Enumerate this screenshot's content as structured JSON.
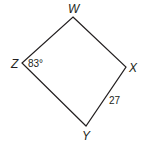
{
  "figure": {
    "shape": "quadrilateral",
    "vertices": [
      {
        "name": "W",
        "x": 73,
        "y": 17
      },
      {
        "name": "X",
        "x": 126,
        "y": 67
      },
      {
        "name": "Y",
        "x": 86,
        "y": 126
      },
      {
        "name": "Z",
        "x": 22,
        "y": 63
      }
    ],
    "labels": {
      "W": "W",
      "X": "X",
      "Y": "Y",
      "Z": "Z"
    },
    "angle_label": "83°",
    "side_label": "27",
    "stroke_color": "#231f20"
  }
}
